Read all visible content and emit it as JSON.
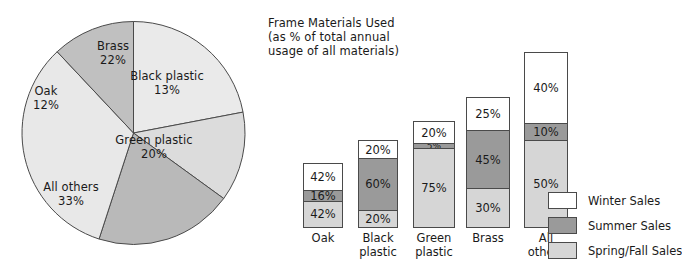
{
  "colors": {
    "winter": "#ffffff",
    "summer": "#9a9a9a",
    "spring_fall": "#d6d6d6",
    "pie_light": "#e8e8e8",
    "pie_mid": "#d8d8d8",
    "pie_dark": "#b4b4b4",
    "stroke": "#4a4a4a",
    "text": "#1a1a1a"
  },
  "pie": {
    "slices": [
      {
        "label": "Brass",
        "value_label": "22%",
        "value": 22,
        "fill": "#eaeaea",
        "label_x": 113,
        "label_y": 47
      },
      {
        "label": "Black plastic",
        "value_label": "13%",
        "value": 13,
        "fill": "#dcdcdc",
        "label_x": 166,
        "label_y": 76
      },
      {
        "label": "Green plastic",
        "value_label": "20%",
        "value": 20,
        "fill": "#b9b9b9",
        "label_x": 152,
        "label_y": 139
      },
      {
        "label": "All others",
        "value_label": "33%",
        "value": 33,
        "fill": "#e8e8e8",
        "label_x": 67,
        "label_y": 186
      },
      {
        "label": "Oak",
        "value_label": "12%",
        "value": 12,
        "fill": "#c0c0c0",
        "label_x": 45,
        "label_y": 91
      }
    ]
  },
  "bars": {
    "title": "Frame Materials Used\n(as % of total annual\nusage of all materials)",
    "categories": [
      {
        "label": "Oak",
        "total": 100,
        "segments": [
          {
            "series": "Winter Sales",
            "value_label": "42%",
            "value": 42
          },
          {
            "series": "Summer Sales",
            "value_label": "16%",
            "value": 16
          },
          {
            "series": "Spring/Fall Sales",
            "value_label": "42%",
            "value": 42
          }
        ]
      },
      {
        "label": "Black\nplastic",
        "total": 100,
        "segments": [
          {
            "series": "Winter Sales",
            "value_label": "20%",
            "value": 20
          },
          {
            "series": "Summer Sales",
            "value_label": "60%",
            "value": 60
          },
          {
            "series": "Spring/Fall Sales",
            "value_label": "20%",
            "value": 20
          }
        ]
      },
      {
        "label": "Green\nplastic",
        "total": 100,
        "segments": [
          {
            "series": "Winter Sales",
            "value_label": "20%",
            "value": 20
          },
          {
            "series": "Summer Sales",
            "value_label": "5%",
            "value": 5
          },
          {
            "series": "Spring/Fall Sales",
            "value_label": "75%",
            "value": 75
          }
        ]
      },
      {
        "label": "Brass",
        "total": 100,
        "segments": [
          {
            "series": "Winter Sales",
            "value_label": "25%",
            "value": 25
          },
          {
            "series": "Summer Sales",
            "value_label": "45%",
            "value": 45
          },
          {
            "series": "Spring/Fall Sales",
            "value_label": "30%",
            "value": 30
          }
        ]
      },
      {
        "label": "All\nothers",
        "total": 100,
        "segments": [
          {
            "series": "Winter Sales",
            "value_label": "40%",
            "value": 40
          },
          {
            "series": "Summer Sales",
            "value_label": "10%",
            "value": 10
          },
          {
            "series": "Spring/Fall Sales",
            "value_label": "50%",
            "value": 50
          }
        ]
      }
    ]
  },
  "legend": {
    "items": [
      {
        "label": "Winter Sales",
        "fill": "#ffffff"
      },
      {
        "label": "Summer Sales",
        "fill": "#9a9a9a"
      },
      {
        "label": "Spring/Fall Sales",
        "fill": "#d6d6d6"
      }
    ]
  },
  "chart_data": [
    {
      "type": "pie",
      "title": "",
      "categories": [
        "Brass",
        "Black plastic",
        "Green plastic",
        "All others",
        "Oak"
      ],
      "values": [
        22,
        13,
        20,
        33,
        12
      ],
      "value_labels": [
        "22%",
        "13%",
        "20%",
        "33%",
        "12%"
      ],
      "units": "percent",
      "legend": "none (labels on slices)",
      "note": "Frame materials used as % of total annual usage of all materials"
    },
    {
      "type": "bar",
      "subtype": "stacked-100-percent",
      "title": "Frame Materials Used (as % of total annual usage of all materials)",
      "xlabel": "",
      "ylabel": "",
      "ylim": [
        0,
        100
      ],
      "grid": false,
      "legend_position": "right-bottom",
      "categories": [
        "Oak",
        "Black plastic",
        "Green plastic",
        "Brass",
        "All others"
      ],
      "bar_total_heights_percent_of_usage": [
        22,
        30,
        47,
        57,
        70
      ],
      "series": [
        {
          "name": "Winter Sales",
          "values": [
            42,
            20,
            20,
            25,
            40
          ]
        },
        {
          "name": "Summer Sales",
          "values": [
            16,
            60,
            5,
            45,
            10
          ]
        },
        {
          "name": "Spring/Fall Sales",
          "values": [
            42,
            20,
            75,
            30,
            50
          ]
        }
      ]
    }
  ]
}
